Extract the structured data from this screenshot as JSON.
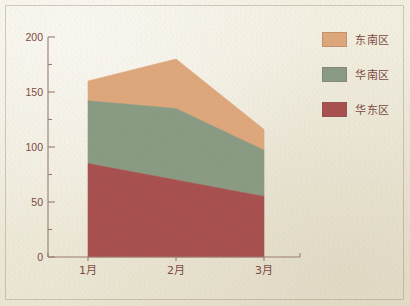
{
  "figure": {
    "background_color": "#f1edde",
    "text_color": "#7b4a41",
    "axis_color": "#9b7c6e"
  },
  "chart_data": {
    "type": "area",
    "stacked": true,
    "title": "",
    "subtitle": "",
    "xlabel": "",
    "ylabel": "",
    "categories": [
      "1月",
      "2月",
      "3月"
    ],
    "ylim": [
      0,
      200
    ],
    "yticks": [
      0,
      50,
      100,
      150,
      200
    ],
    "ytick_labels": [
      "0",
      "50",
      "100",
      "150",
      "200"
    ],
    "y_minor_ticks": [
      25,
      75,
      125,
      175
    ],
    "grid": false,
    "legend_position": "right",
    "series": [
      {
        "name": "华东区",
        "color": "#a8504f",
        "values": [
          85,
          70,
          55
        ],
        "cumulative_top": [
          85,
          70,
          55
        ]
      },
      {
        "name": "华南区",
        "color": "#8a9b84",
        "values": [
          57,
          65,
          42
        ],
        "cumulative_top": [
          142,
          135,
          97
        ]
      },
      {
        "name": "东南区",
        "color": "#dfa77c",
        "values": [
          18,
          45,
          19
        ],
        "cumulative_top": [
          160,
          180,
          116
        ]
      }
    ],
    "totals": [
      160,
      180,
      116
    ]
  },
  "legend": {
    "items": [
      {
        "label": "东南区",
        "color": "#dfa77c"
      },
      {
        "label": "华南区",
        "color": "#8a9b84"
      },
      {
        "label": "华东区",
        "color": "#a8504f"
      }
    ]
  },
  "axes": {
    "y_labels": [
      "200",
      "150",
      "100",
      "50",
      "0"
    ],
    "x_labels": [
      "1月",
      "2月",
      "3月"
    ]
  }
}
